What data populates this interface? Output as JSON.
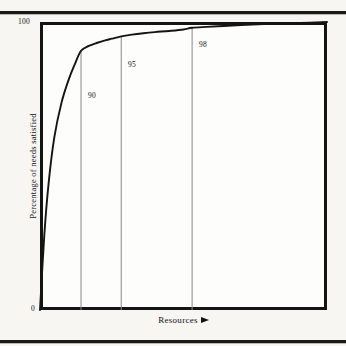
{
  "figure": {
    "background_color": "#f7f6f3",
    "frame_color": "#141414",
    "curve_color": "#141414",
    "marker_line_color": "#8a8a8a"
  },
  "axes": {
    "y_title": "Percentage of needs satisfied",
    "y_max_label": "100",
    "y_min_label": "0",
    "x_title": "Resources",
    "x_arrow_icon": "right-arrow-icon"
  },
  "markers": [
    {
      "label": "90",
      "x_frac": 0.143,
      "label_left": 88,
      "label_top": 91
    },
    {
      "label": "95",
      "x_frac": 0.283,
      "label_left": 128,
      "label_top": 60
    },
    {
      "label": "98",
      "x_frac": 0.53,
      "label_left": 199,
      "label_top": 40
    }
  ],
  "chart_data": {
    "type": "line",
    "title": "",
    "xlabel": "Resources",
    "ylabel": "Percentage of needs satisfied",
    "xlim": [
      0,
      100
    ],
    "ylim": [
      0,
      100
    ],
    "grid": false,
    "legend": null,
    "x_tick_labels": [],
    "y_tick_labels": [
      "0",
      "100"
    ],
    "annotations": [
      {
        "text": "90",
        "x": 14.3,
        "y": 90,
        "note": "vertical reference line at 90% of needs satisfied"
      },
      {
        "text": "95",
        "x": 28.3,
        "y": 95,
        "note": "vertical reference line at 95% of needs satisfied"
      },
      {
        "text": "98",
        "x": 53.0,
        "y": 98,
        "note": "vertical reference line at 98% of needs satisfied"
      }
    ],
    "series": [
      {
        "name": "Percentage of needs satisfied vs resources",
        "x": [
          0,
          1.5,
          3,
          5,
          7.5,
          10,
          12,
          14.3,
          17,
          20,
          23,
          25,
          28.3,
          32,
          36,
          40,
          45,
          50,
          53,
          58,
          64,
          70,
          76,
          82,
          88,
          94,
          100
        ],
        "y": [
          0,
          26,
          44,
          60,
          72,
          80,
          85,
          90,
          91.7,
          92.8,
          93.7,
          94.2,
          95,
          95.6,
          96.1,
          96.5,
          96.9,
          97.4,
          98,
          98.3,
          98.6,
          98.9,
          99.2,
          99.4,
          99.6,
          99.8,
          100
        ]
      }
    ]
  }
}
